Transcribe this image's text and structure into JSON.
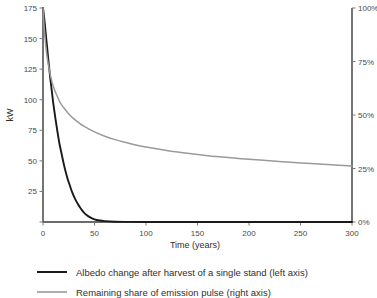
{
  "chart_data": {
    "type": "line",
    "title": "",
    "xlabel": "Time (years)",
    "ylabel": "kW",
    "y2label": "",
    "xlim": [
      0,
      300
    ],
    "ylim": [
      0,
      175
    ],
    "y2lim": [
      0,
      100
    ],
    "grid": false,
    "legend_position": "below",
    "x_ticks": [
      0,
      50,
      100,
      150,
      200,
      250,
      300
    ],
    "x_tick_labels": [
      "0",
      "50",
      "100",
      "150",
      "200",
      "250",
      "300"
    ],
    "y_ticks": [
      0,
      25,
      50,
      75,
      100,
      125,
      150,
      175
    ],
    "y_tick_labels": [
      "",
      "25",
      "50",
      "75",
      "100",
      "125",
      "150",
      "175"
    ],
    "y2_ticks": [
      0,
      25,
      50,
      75,
      100
    ],
    "y2_tick_labels": [
      "0%",
      "25%",
      "50%",
      "75%",
      "100%"
    ],
    "series": [
      {
        "name": "Albedo change after harvest of a single stand (left axis)",
        "axis": "left",
        "color": "#1a1a1a",
        "width": 1.9,
        "x": [
          0,
          1,
          2,
          3,
          4,
          5,
          6,
          7,
          8,
          9,
          10,
          12,
          14,
          16,
          18,
          20,
          22,
          24,
          26,
          28,
          30,
          32,
          34,
          36,
          38,
          40,
          42,
          45,
          50,
          55,
          60,
          70,
          80,
          100,
          150,
          200,
          250,
          300
        ],
        "values": [
          175,
          168,
          160,
          151,
          143,
          134,
          126,
          118,
          111,
          104,
          97,
          85,
          74,
          64,
          56,
          48,
          41,
          35,
          30,
          25,
          21,
          17.5,
          14.5,
          11.8,
          9.5,
          7.5,
          6.0,
          4.2,
          2.2,
          1.2,
          0.7,
          0.25,
          0.1,
          0.0,
          0.0,
          0.0,
          0.0,
          0.0
        ]
      },
      {
        "name": "Remaining share of emission pulse (right axis)",
        "axis": "right",
        "color": "#9a9a9a",
        "width": 1.5,
        "x": [
          0,
          1,
          2,
          3,
          4,
          5,
          7,
          9,
          11,
          14,
          17,
          20,
          25,
          30,
          35,
          40,
          50,
          60,
          70,
          80,
          90,
          100,
          120,
          140,
          160,
          180,
          200,
          220,
          240,
          260,
          280,
          300
        ],
        "values": [
          100,
          92,
          86,
          81,
          77,
          74,
          69,
          65,
          62,
          58.5,
          55.5,
          53.5,
          50.5,
          48.2,
          46.3,
          44.7,
          42.1,
          40.1,
          38.5,
          37.2,
          36.0,
          35.0,
          33.4,
          32.1,
          31.0,
          30.1,
          29.3,
          28.6,
          27.9,
          27.3,
          26.7,
          26.2
        ]
      }
    ]
  },
  "axes": {
    "y_left_title": "kW",
    "x_title": "Time (years)"
  },
  "legend": {
    "items": [
      {
        "label": "Albedo change after harvest of a single stand (left axis)",
        "color": "#1a1a1a"
      },
      {
        "label": "Remaining share of emission pulse (right axis)",
        "color": "#9a9a9a"
      }
    ]
  }
}
